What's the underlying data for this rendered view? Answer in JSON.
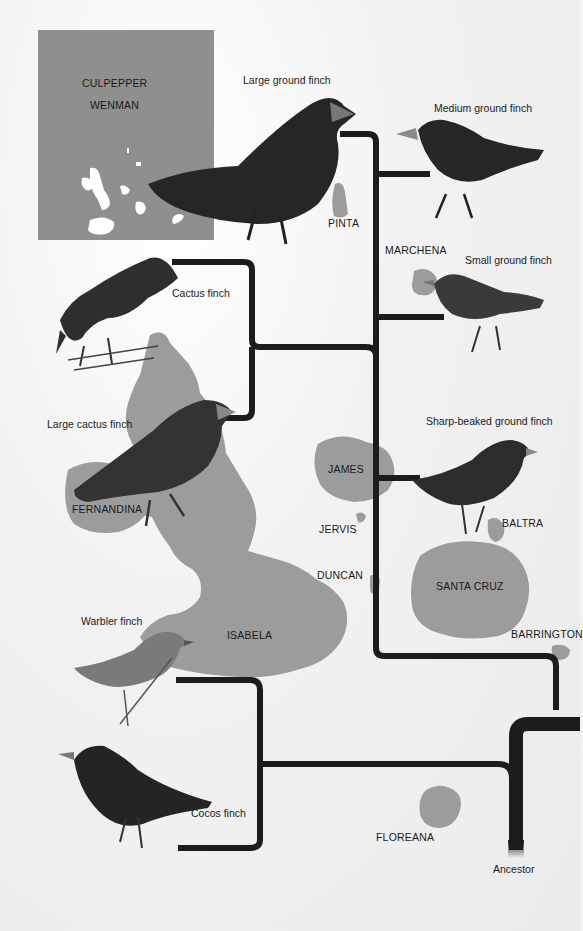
{
  "inset_map": {
    "labels": [
      "CULPEPPER",
      "WENMAN"
    ],
    "background": "#8f8f8f"
  },
  "islands": [
    {
      "name": "PINTA"
    },
    {
      "name": "MARCHENA"
    },
    {
      "name": "JAMES"
    },
    {
      "name": "JERVIS"
    },
    {
      "name": "DUNCAN"
    },
    {
      "name": "BALTRA"
    },
    {
      "name": "SANTA CRUZ"
    },
    {
      "name": "BARRINGTON"
    },
    {
      "name": "FERNANDINA"
    },
    {
      "name": "ISABELA"
    },
    {
      "name": "FLOREANA"
    }
  ],
  "finches": [
    {
      "name": "Large ground finch"
    },
    {
      "name": "Medium ground finch"
    },
    {
      "name": "Small ground finch"
    },
    {
      "name": "Cactus finch"
    },
    {
      "name": "Large cactus finch"
    },
    {
      "name": "Sharp-beaked ground finch"
    },
    {
      "name": "Warbler finch"
    },
    {
      "name": "Cocos finch"
    }
  ],
  "root": {
    "label": "Ancestor"
  },
  "colors": {
    "tree": "#1c1c1c",
    "land": "#9a9a9a",
    "bird": "#2a2a2a",
    "paper": "#f2f2f2"
  }
}
